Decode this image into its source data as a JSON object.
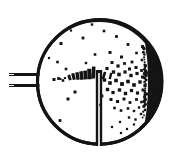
{
  "figure": {
    "title": "Spray deposition chamber cross-section",
    "style": "black-and-white scanned line art",
    "ink_color": "#141414",
    "background_color": "#ffffff",
    "width": 172,
    "height": 162
  },
  "chamber": {
    "name": "circular chamber wall",
    "center_x": 99.5,
    "center_y": 82.0,
    "radius": 62.0,
    "stroke_width": 3.2,
    "wall_thickness_variation": [
      2.4,
      4.2
    ]
  },
  "inlet": {
    "name": "nozzle inlet",
    "position": "left",
    "bars": [
      {
        "x1": 9.0,
        "y1": 74.5,
        "x2": 39.5,
        "y2": 74.5,
        "stroke_width": 3.0
      },
      {
        "x1": 9.0,
        "y1": 85.5,
        "x2": 39.5,
        "y2": 85.5,
        "stroke_width": 3.0
      }
    ],
    "gap_marks": [
      {
        "x1": 9.0,
        "y1": 74.5,
        "x2": 14.0,
        "y2": 74.5
      },
      {
        "x1": 9.0,
        "y1": 85.5,
        "x2": 14.0,
        "y2": 85.5
      }
    ]
  },
  "probe": {
    "name": "vertical probe",
    "x": 99.0,
    "y_top": 70.0,
    "y_bottom": 146.0,
    "outer_width": 6.4,
    "inner_gap_width": 1.6
  },
  "deposit": {
    "name": "wall deposit crescent",
    "side": "right-inner-wall",
    "angle_start_deg": -42,
    "angle_end_deg": 42,
    "max_thickness": 13.0,
    "fill": "#141414"
  },
  "jet_streak": {
    "name": "horizontal particle jet streak",
    "y_center": 79.0,
    "x_start": 60.0,
    "x_end": 113.0,
    "segments": [
      {
        "x": 60.5,
        "y": 79.0,
        "w": 2.0,
        "h": 1.8,
        "rot": 0
      },
      {
        "x": 65.0,
        "y": 78.0,
        "w": 2.2,
        "h": 2.0,
        "rot": 0
      },
      {
        "x": 69.5,
        "y": 77.5,
        "w": 3.0,
        "h": 5.5,
        "rot": -18
      },
      {
        "x": 73.5,
        "y": 76.5,
        "w": 3.2,
        "h": 6.5,
        "rot": -14
      },
      {
        "x": 77.5,
        "y": 76.0,
        "w": 3.4,
        "h": 7.5,
        "rot": -10
      },
      {
        "x": 81.5,
        "y": 75.5,
        "w": 3.6,
        "h": 8.5,
        "rot": -8
      },
      {
        "x": 85.5,
        "y": 75.0,
        "w": 3.8,
        "h": 9.0,
        "rot": -6
      },
      {
        "x": 89.5,
        "y": 74.0,
        "w": 4.0,
        "h": 10.5,
        "rot": -4
      },
      {
        "x": 93.5,
        "y": 72.5,
        "w": 3.6,
        "h": 12.0,
        "rot": 2
      },
      {
        "x": 104.0,
        "y": 75.5,
        "w": 2.6,
        "h": 7.5,
        "rot": 16
      },
      {
        "x": 110.5,
        "y": 76.0,
        "w": 2.4,
        "h": 6.5,
        "rot": 14
      }
    ]
  },
  "particles": {
    "name": "scattered particles",
    "count": 96,
    "size_range": [
      1.2,
      3.2
    ],
    "density_note": "sparse in the upper-left, dense in the right half toward the wall deposit",
    "points": [
      {
        "x": 61.0,
        "y": 43.5,
        "r": 1.5
      },
      {
        "x": 83.0,
        "y": 38.0,
        "r": 1.4
      },
      {
        "x": 104.0,
        "y": 31.0,
        "r": 1.3
      },
      {
        "x": 116.5,
        "y": 36.5,
        "r": 1.4
      },
      {
        "x": 128.0,
        "y": 44.5,
        "r": 1.4
      },
      {
        "x": 136.5,
        "y": 53.0,
        "r": 1.3
      },
      {
        "x": 110.0,
        "y": 52.5,
        "r": 1.5
      },
      {
        "x": 121.5,
        "y": 57.0,
        "r": 1.5
      },
      {
        "x": 95.0,
        "y": 54.5,
        "r": 1.3
      },
      {
        "x": 132.0,
        "y": 62.0,
        "r": 1.4
      },
      {
        "x": 142.0,
        "y": 60.0,
        "r": 1.3
      },
      {
        "x": 147.0,
        "y": 52.0,
        "r": 1.2
      },
      {
        "x": 57.5,
        "y": 62.0,
        "r": 1.3
      },
      {
        "x": 66.0,
        "y": 69.0,
        "r": 1.3
      },
      {
        "x": 54.0,
        "y": 79.5,
        "r": 1.5
      },
      {
        "x": 58.5,
        "y": 78.5,
        "r": 1.4
      },
      {
        "x": 63.0,
        "y": 80.5,
        "r": 1.3
      },
      {
        "x": 112.0,
        "y": 62.5,
        "r": 1.5
      },
      {
        "x": 118.0,
        "y": 66.0,
        "r": 1.6
      },
      {
        "x": 124.5,
        "y": 63.5,
        "r": 1.4
      },
      {
        "x": 129.5,
        "y": 69.0,
        "r": 1.5
      },
      {
        "x": 136.0,
        "y": 67.5,
        "r": 1.5
      },
      {
        "x": 141.5,
        "y": 70.5,
        "r": 1.4
      },
      {
        "x": 145.5,
        "y": 65.5,
        "r": 1.3
      },
      {
        "x": 107.0,
        "y": 68.5,
        "r": 1.6
      },
      {
        "x": 113.5,
        "y": 72.0,
        "r": 1.7
      },
      {
        "x": 119.0,
        "y": 74.5,
        "r": 1.8
      },
      {
        "x": 125.0,
        "y": 72.0,
        "r": 1.6
      },
      {
        "x": 131.0,
        "y": 75.5,
        "r": 1.7
      },
      {
        "x": 137.0,
        "y": 73.5,
        "r": 1.6
      },
      {
        "x": 142.5,
        "y": 77.0,
        "r": 1.5
      },
      {
        "x": 147.5,
        "y": 73.0,
        "r": 1.4
      },
      {
        "x": 104.5,
        "y": 80.0,
        "r": 1.7
      },
      {
        "x": 110.0,
        "y": 83.0,
        "r": 1.8
      },
      {
        "x": 116.0,
        "y": 80.5,
        "r": 1.8
      },
      {
        "x": 122.0,
        "y": 84.0,
        "r": 1.9
      },
      {
        "x": 128.0,
        "y": 81.5,
        "r": 1.8
      },
      {
        "x": 134.0,
        "y": 85.0,
        "r": 1.8
      },
      {
        "x": 140.0,
        "y": 82.0,
        "r": 1.7
      },
      {
        "x": 145.0,
        "y": 85.5,
        "r": 1.6
      },
      {
        "x": 149.5,
        "y": 80.0,
        "r": 1.4
      },
      {
        "x": 107.5,
        "y": 89.5,
        "r": 1.7
      },
      {
        "x": 113.0,
        "y": 92.5,
        "r": 1.6
      },
      {
        "x": 119.5,
        "y": 90.0,
        "r": 1.7
      },
      {
        "x": 125.5,
        "y": 93.5,
        "r": 1.7
      },
      {
        "x": 131.5,
        "y": 90.5,
        "r": 1.6
      },
      {
        "x": 137.5,
        "y": 93.0,
        "r": 1.6
      },
      {
        "x": 143.0,
        "y": 90.0,
        "r": 1.5
      },
      {
        "x": 147.0,
        "y": 94.0,
        "r": 1.3
      },
      {
        "x": 111.0,
        "y": 99.5,
        "r": 1.5
      },
      {
        "x": 117.5,
        "y": 101.5,
        "r": 1.5
      },
      {
        "x": 124.0,
        "y": 99.0,
        "r": 1.5
      },
      {
        "x": 130.0,
        "y": 102.5,
        "r": 1.4
      },
      {
        "x": 136.5,
        "y": 99.5,
        "r": 1.4
      },
      {
        "x": 141.5,
        "y": 102.0,
        "r": 1.3
      },
      {
        "x": 114.5,
        "y": 108.0,
        "r": 1.3
      },
      {
        "x": 121.0,
        "y": 110.5,
        "r": 1.3
      },
      {
        "x": 128.0,
        "y": 108.5,
        "r": 1.3
      },
      {
        "x": 134.0,
        "y": 111.0,
        "r": 1.2
      },
      {
        "x": 139.0,
        "y": 107.5,
        "r": 1.2
      },
      {
        "x": 102.0,
        "y": 96.0,
        "r": 1.4
      },
      {
        "x": 100.5,
        "y": 105.0,
        "r": 1.2
      },
      {
        "x": 75.0,
        "y": 92.0,
        "r": 1.5
      },
      {
        "x": 68.0,
        "y": 99.0,
        "r": 1.5
      },
      {
        "x": 60.0,
        "y": 120.5,
        "r": 1.4
      },
      {
        "x": 86.0,
        "y": 63.0,
        "r": 1.2
      },
      {
        "x": 129.0,
        "y": 117.5,
        "r": 1.2
      },
      {
        "x": 135.5,
        "y": 119.5,
        "r": 1.2
      },
      {
        "x": 141.0,
        "y": 114.0,
        "r": 1.2
      },
      {
        "x": 120.0,
        "y": 122.0,
        "r": 1.1
      },
      {
        "x": 112.0,
        "y": 127.0,
        "r": 1.1
      },
      {
        "x": 150.0,
        "y": 88.0,
        "r": 1.3
      },
      {
        "x": 151.5,
        "y": 96.0,
        "r": 1.2
      },
      {
        "x": 148.0,
        "y": 103.0,
        "r": 1.2
      },
      {
        "x": 143.5,
        "y": 48.0,
        "r": 1.2
      },
      {
        "x": 92.0,
        "y": 24.5,
        "r": 1.2
      },
      {
        "x": 71.0,
        "y": 30.5,
        "r": 1.1
      },
      {
        "x": 49.0,
        "y": 58.0,
        "r": 1.1
      }
    ]
  },
  "wall_notches": {
    "name": "wall tick marks",
    "points": [
      {
        "x": 95.0,
        "y": 19.5
      },
      {
        "x": 106.0,
        "y": 20.0
      },
      {
        "x": 112.0,
        "y": 21.0
      },
      {
        "x": 127.0,
        "y": 129.0
      },
      {
        "x": 134.0,
        "y": 124.5
      },
      {
        "x": 121.0,
        "y": 133.0
      }
    ]
  }
}
